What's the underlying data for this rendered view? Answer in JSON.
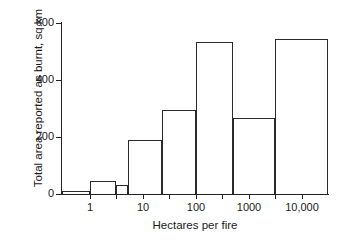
{
  "chart_data": {
    "type": "bar",
    "title": "",
    "subtitle": "",
    "xlabel": "Hectares per fire",
    "ylabel": "Total area reported as burnt, sq.km",
    "xscale": "log",
    "grid": false,
    "legend": null,
    "annotations": [],
    "ylim": [
      0,
      600
    ],
    "ytick_labels": [
      "0",
      "200",
      "400",
      "600"
    ],
    "ytick_values": [
      0,
      200,
      400,
      600
    ],
    "xtick_labels": [
      "1",
      "10",
      "100",
      "1000",
      "10,000"
    ],
    "xtick_values": [
      1,
      10,
      100,
      1000,
      10000
    ],
    "xlim": [
      0.3,
      31623
    ],
    "bin_edges": [
      0.3,
      1,
      3.2,
      10,
      32,
      100,
      500,
      3200,
      31623
    ],
    "categories": [
      "0.3–1",
      "1–3.2",
      "3.2–10",
      "10–32",
      "32–100",
      "100–500",
      "500–3200",
      "3200–31623"
    ],
    "values": [
      10,
      45,
      33,
      188,
      293,
      533,
      268,
      545
    ],
    "bars": [
      {
        "label": "0.3–1",
        "x0": 0.3,
        "x1": 1,
        "value": 10
      },
      {
        "label": "1–3.2",
        "x0": 1,
        "x1": 3.2,
        "value": 45
      },
      {
        "label": "3.2–10",
        "x0": 3.2,
        "x1": 5.2,
        "value": 33
      },
      {
        "label": "10–32",
        "x0": 5.2,
        "x1": 23,
        "value": 188
      },
      {
        "label": "32–100",
        "x0": 23,
        "x1": 100,
        "value": 293
      },
      {
        "label": "100–500",
        "x0": 100,
        "x1": 500,
        "value": 533
      },
      {
        "label": "500–3200",
        "x0": 500,
        "x1": 3200,
        "value": 268
      },
      {
        "label": "3200–31623",
        "x0": 3200,
        "x1": 31623,
        "value": 545
      }
    ]
  },
  "axes": {
    "y_title": "Total area reported as burnt, sq.km",
    "x_title": "Hectares per fire",
    "y_labels": [
      "600",
      "400",
      "200",
      "0"
    ],
    "x_labels": [
      "1",
      "10",
      "100",
      "1000",
      "10,000"
    ]
  },
  "colors": {
    "ink": "#1a1a1a",
    "bar_stroke": "#2b2b2b",
    "background": "#ffffff"
  }
}
